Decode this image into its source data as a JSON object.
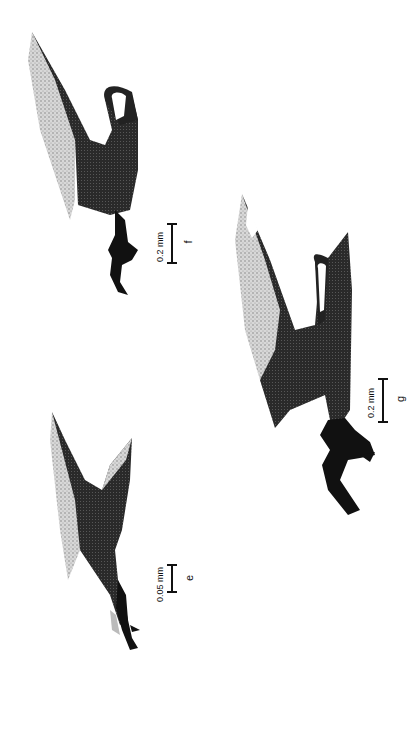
{
  "figure": {
    "orientation": "rotated-90-ccw",
    "panels": [
      {
        "id": "e",
        "label": "e",
        "scale_bar": "0.05 mm"
      },
      {
        "id": "f",
        "label": "f",
        "scale_bar": "0.2 mm"
      },
      {
        "id": "g",
        "label": "g",
        "scale_bar": "0.2 mm"
      }
    ]
  },
  "colors": {
    "background": "#ffffff",
    "ink": "#111111",
    "stipple_light": "#9a9a9a",
    "stipple_mid": "#555555"
  }
}
